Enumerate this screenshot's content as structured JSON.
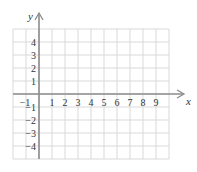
{
  "chart_data": {
    "type": "scatter",
    "title": "",
    "xlabel": "x",
    "ylabel": "y",
    "xlim": [
      -2,
      10
    ],
    "ylim": [
      -5,
      5
    ],
    "grid": true,
    "x_ticks": [
      -1,
      1,
      2,
      3,
      4,
      5,
      6,
      7,
      8,
      9
    ],
    "y_ticks": [
      4,
      3,
      2,
      1,
      -1,
      -2,
      -3,
      -4
    ],
    "x_tick_labels": [
      "−1",
      "1",
      "2",
      "3",
      "4",
      "5",
      "6",
      "7",
      "8",
      "9"
    ],
    "y_tick_labels": [
      "4",
      "3",
      "2",
      "1",
      "−1",
      "−2",
      "−3",
      "−4"
    ],
    "series": [],
    "legend": null
  },
  "colors": {
    "grid": "#d9d9d9",
    "axis": "#8c8c8c",
    "text": "#333333"
  }
}
